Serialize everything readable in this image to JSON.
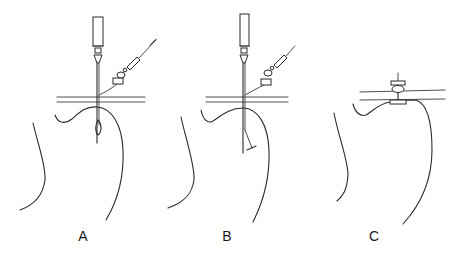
{
  "figure": {
    "panels": [
      {
        "id": "A",
        "label": "A",
        "stage": "needle inserted with sheath and tether"
      },
      {
        "id": "B",
        "label": "B",
        "stage": "needle inserted, anchor deployed at tip"
      },
      {
        "id": "C",
        "label": "C",
        "stage": "button device seated at skin surface"
      }
    ],
    "colors": {
      "line": "#2a2a2a",
      "background": "#ffffff"
    }
  }
}
